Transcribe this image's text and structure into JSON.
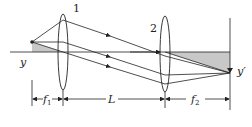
{
  "diagram": {
    "labels": {
      "lens1": "1",
      "lens2": "2",
      "object": "y",
      "image": "y′",
      "f1_main": "f",
      "f1_sub": "1",
      "L": "L",
      "f2_main": "f",
      "f2_sub": "2"
    },
    "colors": {
      "line": "#222222",
      "shade": "#c8c8c8",
      "background": "#ffffff"
    },
    "elements": [
      "optical-axis",
      "lens-1",
      "lens-2",
      "object-arrow",
      "image-plane",
      "rays",
      "shaded-triangle-object",
      "shaded-triangle-image",
      "dimension-f1",
      "dimension-L",
      "dimension-f2"
    ]
  }
}
